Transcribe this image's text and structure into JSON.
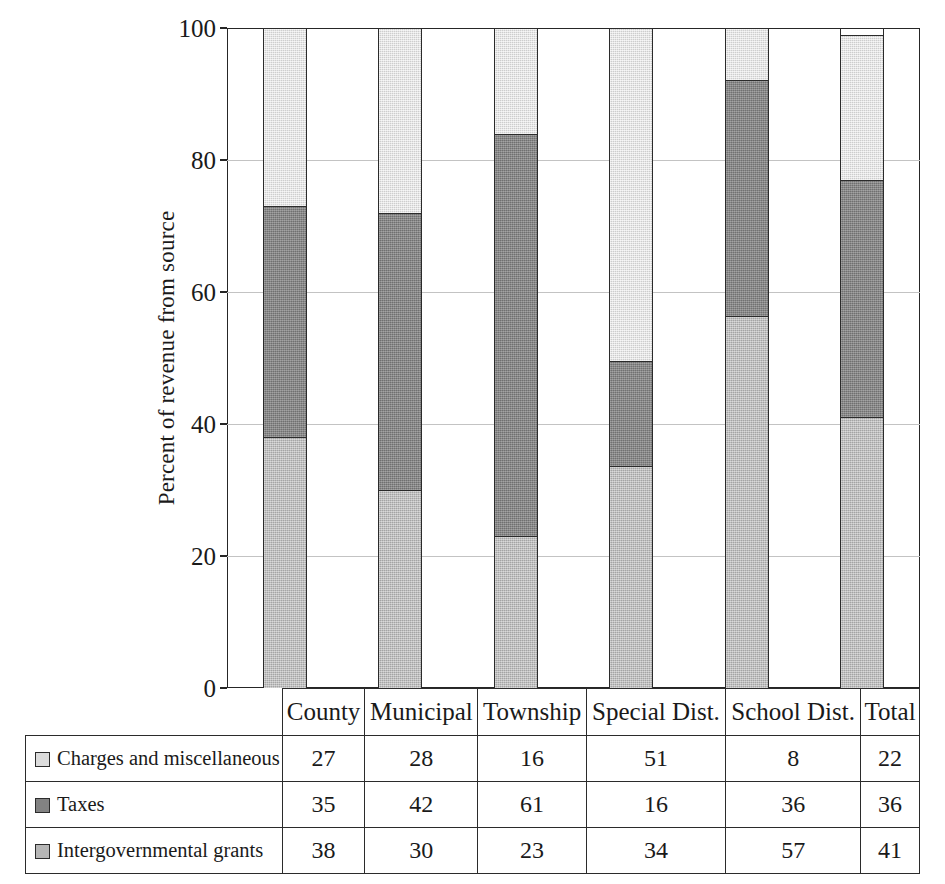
{
  "chart_data": {
    "type": "bar",
    "subtype": "100% stacked column",
    "title": "",
    "xlabel": "",
    "ylabel": "Percent of revenue from source",
    "ylim": [
      0,
      100
    ],
    "yticks": [
      0,
      20,
      40,
      60,
      80,
      100
    ],
    "ytick_labels": [
      "0",
      "20",
      "40",
      "60",
      "80",
      "100"
    ],
    "grid": true,
    "grid_axis": "y",
    "legend_position": "table-row-labels",
    "stack_order_bottom_to_top": [
      "Intergovernmental grants",
      "Taxes",
      "Charges and miscellaneous"
    ],
    "categories": [
      "County",
      "Municipal",
      "Township",
      "Special Dist.",
      "School Dist.",
      "Total"
    ],
    "series": [
      {
        "name": "Charges and miscellaneous",
        "color": "#dcdcdc",
        "values": [
          27,
          28,
          16,
          51,
          8,
          22
        ]
      },
      {
        "name": "Taxes",
        "color": "#828282",
        "values": [
          35,
          42,
          61,
          16,
          36,
          36
        ]
      },
      {
        "name": "Intergovernmental grants",
        "color": "#b6b6b6",
        "values": [
          38,
          30,
          23,
          34,
          57,
          41
        ]
      }
    ]
  },
  "table": {
    "corner_blank": "",
    "column_headers": [
      "County",
      "Municipal",
      "Township",
      "Special Dist.",
      "School Dist.",
      "Total"
    ],
    "rows": [
      {
        "label": "Charges and miscellaneous",
        "swatch_class": "s-charges",
        "swatch_color": "#dcdcdc",
        "values": [
          "27",
          "28",
          "16",
          "51",
          "8",
          "22"
        ]
      },
      {
        "label": "Taxes",
        "swatch_class": "s-taxes",
        "swatch_color": "#828282",
        "values": [
          "35",
          "42",
          "61",
          "16",
          "36",
          "36"
        ]
      },
      {
        "label": "Intergovernmental grants",
        "swatch_class": "s-grants",
        "swatch_color": "#b6b6b6",
        "values": [
          "38",
          "30",
          "23",
          "34",
          "57",
          "41"
        ]
      }
    ]
  },
  "axis": {
    "y_title": "Percent of revenue from source"
  },
  "colors": {
    "charges": "#dcdcdc",
    "taxes": "#828282",
    "grants": "#b6b6b6",
    "axis_line": "#262626",
    "gridline": "#c3c3c3"
  }
}
